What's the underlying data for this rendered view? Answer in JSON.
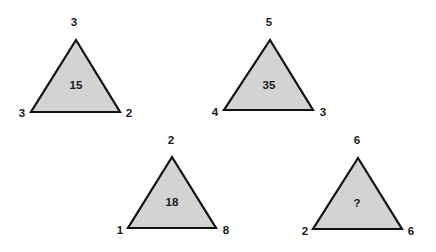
{
  "puzzle": {
    "triangles": [
      {
        "top": "3",
        "left": "3",
        "right": "2",
        "center": "15",
        "apex": [
          76,
          40
        ],
        "bl": [
          31,
          112
        ],
        "br": [
          120,
          112
        ]
      },
      {
        "top": "5",
        "left": "4",
        "right": "3",
        "center": "35",
        "apex": [
          270,
          40
        ],
        "bl": [
          224,
          110
        ],
        "br": [
          313,
          110
        ]
      },
      {
        "top": "2",
        "left": "1",
        "right": "8",
        "center": "18",
        "apex": [
          172,
          157
        ],
        "bl": [
          128,
          228
        ],
        "br": [
          216,
          228
        ]
      },
      {
        "top": "6",
        "left": "2",
        "right": "6",
        "center": "?",
        "apex": [
          358,
          158
        ],
        "bl": [
          313,
          229
        ],
        "br": [
          402,
          229
        ]
      }
    ]
  },
  "colors": {
    "fill": "#d3d3d3",
    "stroke": "#111111",
    "text": "#1a1a1a"
  }
}
